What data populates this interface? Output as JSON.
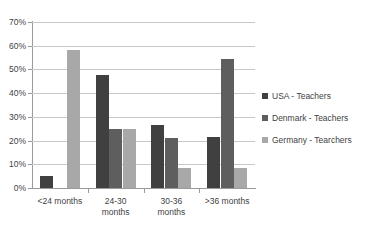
{
  "chart_data": {
    "type": "bar",
    "title": "",
    "subtitle": "",
    "xlabel": "",
    "ylabel": "",
    "categories": [
      "<24 months",
      "24-30 months",
      "30-36 months",
      ">36 months"
    ],
    "series": [
      {
        "name": "USA - Teachers",
        "color": "#404040",
        "values": [
          5.2,
          47.5,
          26.5,
          21.5
        ]
      },
      {
        "name": "Denmark - Teachers",
        "color": "#5e5e5e",
        "values": [
          0,
          25.0,
          21.0,
          54.2
        ]
      },
      {
        "name": "Germany - Tearchers",
        "color": "#a8a8a8",
        "values": [
          58.0,
          25.0,
          8.5,
          8.5
        ]
      }
    ],
    "ylim": [
      0,
      70
    ],
    "y_ticks": [
      0,
      10,
      20,
      30,
      40,
      50,
      60,
      70
    ],
    "y_tick_labels": [
      "0%",
      "10%",
      "20%",
      "30%",
      "40%",
      "50%",
      "60%",
      "70%"
    ],
    "y_tick_suffix": "%",
    "grid": true,
    "grid_axis": "y",
    "legend_position": "right",
    "legend_entries": [
      "USA - Teachers",
      "Denmark - Teachers",
      "Germany - Tearchers"
    ],
    "background": "#ffffff",
    "grid_color": "#c8c8c8",
    "axis_color": "#9a9a9a"
  }
}
